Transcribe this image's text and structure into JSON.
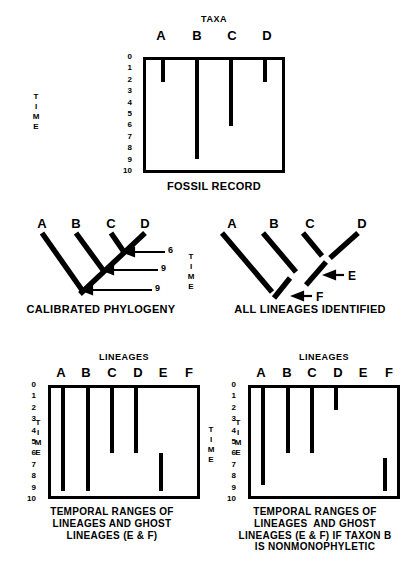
{
  "figure": {
    "background": "#ffffff",
    "ink": "#000000"
  },
  "panels": {
    "fossil_record": {
      "group_header": "TAXA",
      "caption": "FOSSIL RECORD",
      "time_axis_label": "TIME",
      "time_ticks": [
        "0",
        "1",
        "2",
        "3",
        "4",
        "5",
        "6",
        "7",
        "8",
        "9",
        "10"
      ],
      "columns": [
        "A",
        "B",
        "C",
        "D"
      ],
      "chart_data": {
        "type": "bar",
        "title": "FOSSIL RECORD",
        "xlabel": "TAXA",
        "ylabel": "TIME",
        "categories": [
          "A",
          "B",
          "C",
          "D"
        ],
        "ylim": [
          0,
          10
        ],
        "grid": false,
        "legend": "none",
        "bars": [
          {
            "taxon": "A",
            "start": 0,
            "end": 2
          },
          {
            "taxon": "B",
            "start": 0,
            "end": 9
          },
          {
            "taxon": "C",
            "start": 0,
            "end": 6
          },
          {
            "taxon": "D",
            "start": 0,
            "end": 2
          }
        ]
      }
    },
    "calibrated_phylogeny": {
      "caption": "CALIBRATED PHYLOGENY",
      "time_axis_label": "TIME",
      "tips": [
        "A",
        "B",
        "C",
        "D"
      ],
      "node_ages": [
        "6",
        "9",
        "9"
      ]
    },
    "all_lineages": {
      "caption": "ALL LINEAGES IDENTIFIED",
      "tips": [
        "A",
        "B",
        "C",
        "D"
      ],
      "ghost_labels": [
        "E",
        "F"
      ]
    },
    "temporal_ranges_left": {
      "group_header": "LINEAGES",
      "caption": "TEMPORAL RANGES OF\nLINEAGES AND GHOST\nLINEAGES (E & F)",
      "time_axis_label": "TIME",
      "time_ticks": [
        "0",
        "1",
        "2",
        "3",
        "4",
        "5",
        "6",
        "7",
        "8",
        "9",
        "10"
      ],
      "columns": [
        "A",
        "B",
        "C",
        "D",
        "E",
        "F"
      ],
      "chart_data": {
        "type": "bar",
        "title": "TEMPORAL RANGES OF LINEAGES AND GHOST LINEAGES (E & F)",
        "xlabel": "LINEAGES",
        "ylabel": "TIME",
        "categories": [
          "A",
          "B",
          "C",
          "D",
          "E",
          "F"
        ],
        "ylim": [
          0,
          10
        ],
        "grid": false,
        "legend": "none",
        "bars": [
          {
            "lineage": "A",
            "start": 0,
            "end": 9.5
          },
          {
            "lineage": "B",
            "start": 0,
            "end": 9.5
          },
          {
            "lineage": "C",
            "start": 0,
            "end": 6
          },
          {
            "lineage": "D",
            "start": 0,
            "end": 6
          },
          {
            "lineage": "E",
            "start": 6,
            "end": 9.5
          },
          {
            "lineage": "F",
            "start": null,
            "end": null
          }
        ]
      }
    },
    "temporal_ranges_right": {
      "group_header": "LINEAGES",
      "caption": "TEMPORAL RANGES OF\nLINEAGES  AND GHOST\nLINEAGES (E & F) IF TAXON B\nIS NONMONOPHYLETIC",
      "time_axis_label": "TIME",
      "time_ticks": [
        "0",
        "1",
        "2",
        "3",
        "4",
        "5",
        "6",
        "7",
        "8",
        "9",
        "10"
      ],
      "columns": [
        "A",
        "B",
        "C",
        "D",
        "E",
        "F"
      ],
      "chart_data": {
        "type": "bar",
        "title": "TEMPORAL RANGES OF LINEAGES AND GHOST LINEAGES (E & F) IF TAXON B IS NONMONOPHYLETIC",
        "xlabel": "LINEAGES",
        "ylabel": "TIME",
        "categories": [
          "A",
          "B",
          "C",
          "D",
          "E",
          "F"
        ],
        "ylim": [
          0,
          10
        ],
        "grid": false,
        "legend": "none",
        "bars": [
          {
            "lineage": "A",
            "start": 0,
            "end": 9
          },
          {
            "lineage": "B",
            "start": 0,
            "end": 6
          },
          {
            "lineage": "C",
            "start": 0,
            "end": 6
          },
          {
            "lineage": "D",
            "start": 0,
            "end": 2
          },
          {
            "lineage": "E",
            "start": null,
            "end": null
          },
          {
            "lineage": "F",
            "start": 6.5,
            "end": 9.5
          }
        ]
      }
    }
  }
}
